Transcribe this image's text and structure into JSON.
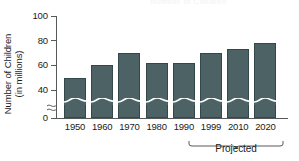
{
  "chart_data": {
    "type": "bar",
    "title": "",
    "xlabel": "",
    "ylabel": "Number of Children (in millions)",
    "ylabel_line1": "Number of Children",
    "ylabel_line2": "(in millions)",
    "categories": [
      "1950",
      "1960",
      "1970",
      "1980",
      "1990",
      "1999",
      "2010",
      "2020"
    ],
    "values": [
      50,
      60,
      70,
      62,
      62,
      70,
      73,
      78
    ],
    "ylim": [
      0,
      100
    ],
    "yticks": [
      100,
      80,
      60,
      40,
      0
    ],
    "ytick_labels": [
      "100",
      "80",
      "60",
      "40",
      "0"
    ],
    "axis_break": true,
    "axis_break_note": "y-axis broken between 0 and 40",
    "grid": false,
    "legend": "none",
    "bar_color": "#4d6265",
    "bar_edge_color": "#33484b",
    "axis_color": "#58595b",
    "annotations": [
      {
        "text": "Projected",
        "covers": [
          "1999",
          "2010",
          "2020"
        ],
        "style": "curly-brace-below-axis"
      }
    ]
  },
  "labels": {
    "projected": "Projected",
    "ghost_title": "Number of Children"
  }
}
